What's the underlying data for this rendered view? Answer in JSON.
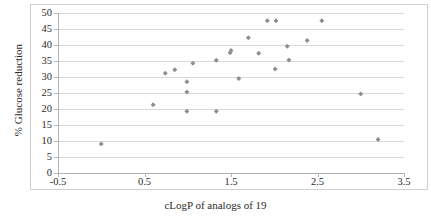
{
  "chart_data": {
    "type": "scatter",
    "title": "",
    "xlabel": "cLogP of analogs of 19",
    "ylabel": "% Glucose reduction",
    "xlim": [
      -0.5,
      3.5
    ],
    "ylim": [
      0,
      50
    ],
    "xticks": [
      -0.5,
      0.5,
      1.5,
      2.5,
      3.5
    ],
    "xtick_labels": [
      "-0.5",
      "0.5",
      "1.5",
      "2.5",
      "3.5"
    ],
    "yticks": [
      0,
      5,
      10,
      15,
      20,
      25,
      30,
      35,
      40,
      45,
      50
    ],
    "ytick_labels": [
      "0",
      "5",
      "10",
      "15",
      "20",
      "25",
      "30",
      "35",
      "40",
      "45",
      "50"
    ],
    "grid": "horizontal",
    "legend": "none",
    "marker": "diamond",
    "marker_color": "#8f8f8f",
    "series": [
      {
        "name": "analogs of 19",
        "points": [
          {
            "x": 0.0,
            "y": 9.1
          },
          {
            "x": 0.6,
            "y": 21.3
          },
          {
            "x": 0.74,
            "y": 31.2
          },
          {
            "x": 0.85,
            "y": 32.3
          },
          {
            "x": 0.99,
            "y": 19.3
          },
          {
            "x": 0.99,
            "y": 25.3
          },
          {
            "x": 0.99,
            "y": 28.5
          },
          {
            "x": 1.06,
            "y": 34.3
          },
          {
            "x": 1.33,
            "y": 19.3
          },
          {
            "x": 1.33,
            "y": 35.2
          },
          {
            "x": 1.49,
            "y": 37.6
          },
          {
            "x": 1.5,
            "y": 38.3
          },
          {
            "x": 1.59,
            "y": 29.5
          },
          {
            "x": 1.7,
            "y": 42.3
          },
          {
            "x": 1.82,
            "y": 37.4
          },
          {
            "x": 1.92,
            "y": 47.6
          },
          {
            "x": 2.01,
            "y": 32.5
          },
          {
            "x": 2.02,
            "y": 47.6
          },
          {
            "x": 2.15,
            "y": 39.6
          },
          {
            "x": 2.17,
            "y": 35.3
          },
          {
            "x": 2.38,
            "y": 41.4
          },
          {
            "x": 2.55,
            "y": 47.6
          },
          {
            "x": 3.0,
            "y": 24.7
          },
          {
            "x": 3.2,
            "y": 10.5
          }
        ]
      }
    ]
  },
  "axes": {
    "y_title": "% Glucose reduction",
    "x_title": "cLogP of analogs of 19"
  }
}
